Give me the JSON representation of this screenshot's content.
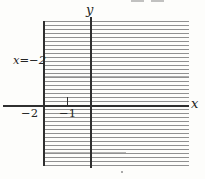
{
  "figure": {
    "type": "coordinate-plane-inequality-graph",
    "y_axis_label": "y",
    "x_axis_label": "x",
    "line_label": "x=−2",
    "x_ticks": [
      {
        "value": -2,
        "label": "−2"
      },
      {
        "value": -1,
        "label": "−1"
      }
    ],
    "shaded_region": "half-plane x ≥ −2",
    "colors": {
      "paper": "#fdfdfb",
      "axis": "#2f2f2f",
      "hatch": "#909090",
      "ink": "#242424"
    }
  }
}
